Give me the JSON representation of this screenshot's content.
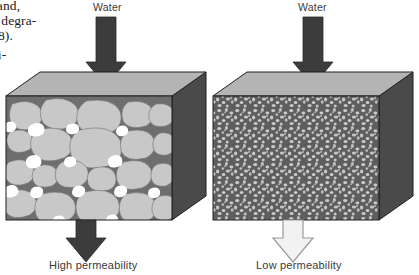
{
  "figure": {
    "kind": "permeability-comparison-diagram",
    "background_color": "#ffffff"
  },
  "margin_text": {
    "lines": [
      "land,",
      "d degra-",
      "8).",
      "ti-"
    ]
  },
  "panels": [
    {
      "id": "high-permeability",
      "inflow_label": "Water",
      "caption": "High permeability",
      "grain": "coarse",
      "outflow_style": "filled",
      "top_face_color": "#b4b4b4",
      "side_face_color": "#4a4a4a",
      "matrix_color": "#6e6e6e",
      "grain_color": "#c8c8c8",
      "pore_color": "#ffffff",
      "arrow_fill": "#3c3c3c",
      "arrow_stroke": "#2a2a2a"
    },
    {
      "id": "low-permeability",
      "inflow_label": "Water",
      "caption": "Low permeability",
      "grain": "fine",
      "outflow_style": "hollow",
      "top_face_color": "#b4b4b4",
      "side_face_color": "#4a4a4a",
      "matrix_color": "#5e5e5e",
      "grain_color": "#c9c9c9",
      "pore_color": "#5e5e5e",
      "arrow_fill": "#3c3c3c",
      "arrow_stroke": "#2a2a2a",
      "outflow_fill": "#f2f2f2",
      "outflow_stroke": "#9a9a9a"
    }
  ]
}
